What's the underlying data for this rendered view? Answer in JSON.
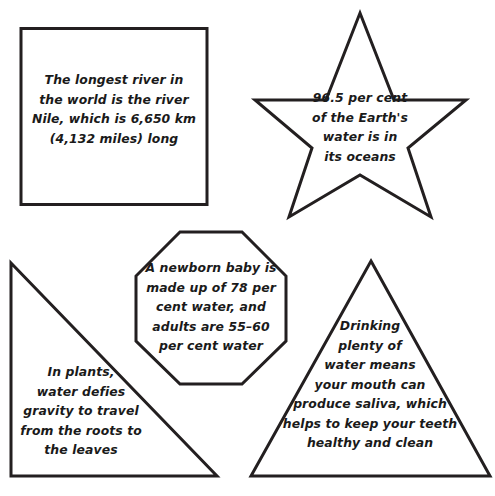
{
  "page": {
    "background_color": "#ffffff",
    "outline_color": "#231f20",
    "text_color": "#1a1a1a"
  },
  "shapes": [
    {
      "id": "square",
      "shape_name": "square",
      "text": "The longest river in\nthe world is the river\nNile, which is 6,650 km\n(4,132 miles) long"
    },
    {
      "id": "star",
      "shape_name": "five-pointed-star",
      "text": "96.5 per cent\nof the Earth's\nwater is in\nits oceans"
    },
    {
      "id": "octagon",
      "shape_name": "octagon",
      "text": "A newborn baby is\nmade up of 78 per\ncent water, and\nadults are 55–60\nper cent water"
    },
    {
      "id": "left-triangle",
      "shape_name": "right-triangle",
      "text": "In plants,\nwater defies\ngravity to travel\nfrom the roots to\nthe leaves"
    },
    {
      "id": "right-triangle",
      "shape_name": "isosceles-triangle",
      "text": "Drinking\nplenty of\nwater means\nyour mouth can\nproduce saliva, which\nhelps to keep your teeth\nhealthy and clean"
    }
  ]
}
